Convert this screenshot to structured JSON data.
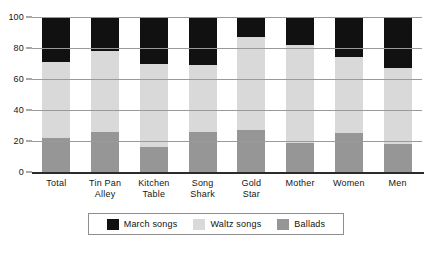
{
  "chart_data": {
    "type": "bar",
    "subtype": "stacked-vertical-percent",
    "title": "",
    "subtitle": "",
    "xlabel": "",
    "ylabel": "",
    "ylim": [
      0,
      100
    ],
    "yticks": [
      0,
      20,
      40,
      60,
      80,
      100
    ],
    "ytick_labels": [
      "0",
      "20",
      "40",
      "60",
      "80",
      "100"
    ],
    "grid": true,
    "grid_axis": "y",
    "legend_position": "bottom-center",
    "stack_order_bottom_to_top": [
      "Ballads",
      "Waltz songs",
      "March songs"
    ],
    "categories": [
      "Total",
      "Tin Pan Alley",
      "Kitchen Table",
      "Song Shark",
      "Gold Star",
      "Mother",
      "Women",
      "Men"
    ],
    "category_lines": [
      [
        "Total"
      ],
      [
        "Tin Pan",
        "Alley"
      ],
      [
        "Kitchen",
        "Table"
      ],
      [
        "Song",
        "Shark"
      ],
      [
        "Gold",
        "Star"
      ],
      [
        "Mother"
      ],
      [
        "Women"
      ],
      [
        "Men"
      ]
    ],
    "series": [
      {
        "name": "March songs",
        "color": "#111111",
        "values": [
          29,
          22,
          30,
          31,
          13,
          18,
          26,
          33
        ]
      },
      {
        "name": "Waltz songs",
        "color": "#d9d9d9",
        "values": [
          49,
          52,
          54,
          43,
          60,
          63,
          49,
          49
        ]
      },
      {
        "name": "Ballads",
        "color": "#969696",
        "values": [
          22,
          26,
          16,
          26,
          27,
          19,
          25,
          18
        ]
      }
    ],
    "cumulative_tops": {
      "Ballads": [
        22,
        26,
        16,
        26,
        27,
        19,
        25,
        18
      ],
      "Waltz songs": [
        71,
        78,
        70,
        69,
        87,
        82,
        74,
        67
      ],
      "March songs": [
        100,
        100,
        100,
        100,
        100,
        100,
        100,
        100
      ]
    }
  },
  "legend": {
    "items": [
      {
        "label": "March songs",
        "color": "#111111"
      },
      {
        "label": "Waltz songs",
        "color": "#d9d9d9"
      },
      {
        "label": "Ballads",
        "color": "#969696"
      }
    ]
  },
  "colors": {
    "march": "#111111",
    "waltz": "#d9d9d9",
    "ballads": "#969696",
    "gridline": "#9a9a9a",
    "axis": "#2b2b2b",
    "text": "#161616",
    "background": "#ffffff"
  }
}
